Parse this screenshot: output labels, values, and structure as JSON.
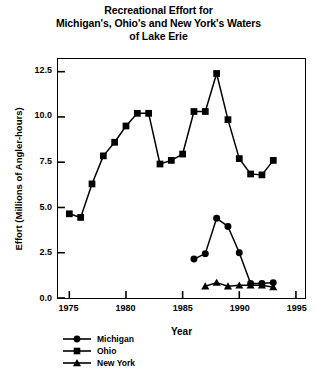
{
  "title": {
    "lines": [
      "Recreational Effort for",
      "Michigan's, Ohio's and New York's Waters",
      "of Lake Erie"
    ]
  },
  "axes": {
    "xlabel": "Year",
    "ylabel": "Effort (Millions of Angler-hours)",
    "xticks": [
      "1975",
      "1980",
      "1985",
      "1990",
      "1995"
    ],
    "yticks": [
      "0.0",
      "2.5",
      "5.0",
      "7.5",
      "10.0",
      "12.5"
    ]
  },
  "legend": {
    "entries": [
      {
        "label": "Michigan",
        "marker": "circle-marker",
        "color": "#000000"
      },
      {
        "label": "Ohio",
        "marker": "square-marker",
        "color": "#000000"
      },
      {
        "label": "New York",
        "marker": "triangle-marker",
        "color": "#000000"
      }
    ]
  },
  "chart_data": {
    "type": "line",
    "title": "Recreational Effort for Michigan's, Ohio's and New York's Waters of Lake Erie",
    "xlabel": "Year",
    "ylabel": "Effort (Millions of Angler-hours)",
    "xlim": [
      1974,
      1995.8
    ],
    "ylim": [
      0.0,
      13.2
    ],
    "xticks": [
      1975,
      1980,
      1985,
      1990,
      1995
    ],
    "yticks": [
      0.0,
      2.5,
      5.0,
      7.5,
      10.0,
      12.5
    ],
    "grid": false,
    "legend_position": "below-left",
    "series": [
      {
        "name": "Michigan",
        "marker": "circle",
        "color": "#000000",
        "x": [
          1986,
          1987,
          1988,
          1989,
          1990,
          1991,
          1992,
          1993
        ],
        "values": [
          2.15,
          2.45,
          4.4,
          3.95,
          2.5,
          0.8,
          0.8,
          0.85
        ]
      },
      {
        "name": "Ohio",
        "marker": "square",
        "color": "#000000",
        "x": [
          1975,
          1976,
          1977,
          1978,
          1979,
          1980,
          1981,
          1982,
          1983,
          1984,
          1985,
          1986,
          1987,
          1988,
          1989,
          1990,
          1991,
          1992,
          1993
        ],
        "values": [
          4.65,
          4.45,
          6.3,
          7.85,
          8.6,
          9.5,
          10.2,
          10.2,
          7.4,
          7.6,
          7.95,
          10.3,
          10.3,
          12.4,
          9.85,
          7.7,
          6.85,
          6.8,
          7.6
        ]
      },
      {
        "name": "New York",
        "marker": "triangle",
        "color": "#000000",
        "x": [
          1987,
          1988,
          1989,
          1990,
          1991,
          1992,
          1993
        ],
        "values": [
          0.65,
          0.85,
          0.65,
          0.7,
          0.7,
          0.7,
          0.6
        ]
      }
    ]
  }
}
